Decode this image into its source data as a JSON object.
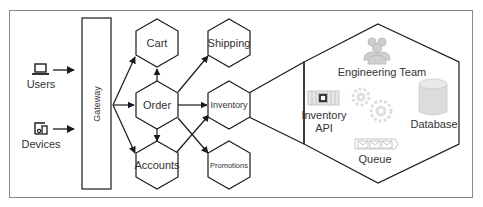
{
  "diagram": {
    "clients": [
      {
        "label": "Users",
        "icon": "laptop-icon"
      },
      {
        "label": "Devices",
        "icon": "devices-icon"
      }
    ],
    "gateway": {
      "label": "Gateway"
    },
    "services": [
      {
        "id": "cart",
        "label": "Cart"
      },
      {
        "id": "order",
        "label": "Order"
      },
      {
        "id": "accounts",
        "label": "Accounts"
      },
      {
        "id": "shipping",
        "label": "Shipping"
      },
      {
        "id": "inventory",
        "label": "Inventory"
      },
      {
        "id": "promotions",
        "label": "Promotions"
      }
    ],
    "edges": [
      {
        "from": "Users",
        "to": "Gateway"
      },
      {
        "from": "Devices",
        "to": "Gateway"
      },
      {
        "from": "Gateway",
        "to": "Cart"
      },
      {
        "from": "Gateway",
        "to": "Order"
      },
      {
        "from": "Gateway",
        "to": "Accounts"
      },
      {
        "from": "Order",
        "to": "Cart"
      },
      {
        "from": "Order",
        "to": "Accounts"
      },
      {
        "from": "Order",
        "to": "Shipping"
      },
      {
        "from": "Order",
        "to": "Inventory"
      },
      {
        "from": "Order",
        "to": "Promotions"
      },
      {
        "from": "Accounts",
        "to": "Inventory"
      }
    ],
    "detail": {
      "of": "Inventory",
      "components": [
        {
          "label": "Engineering Team",
          "icon": "team-icon"
        },
        {
          "label_line1": "Inventory",
          "label_line2": "API",
          "icon": "api-icon"
        },
        {
          "label": "Database",
          "icon": "database-icon"
        },
        {
          "label": "Queue",
          "icon": "queue-icon"
        },
        {
          "label": "",
          "icon": "gears-icon"
        }
      ]
    },
    "colors": {
      "stroke": "#1a1a1a",
      "frame": "#8a8a8a",
      "text": "#333333",
      "faded_icon": "#cfcfcf"
    }
  }
}
